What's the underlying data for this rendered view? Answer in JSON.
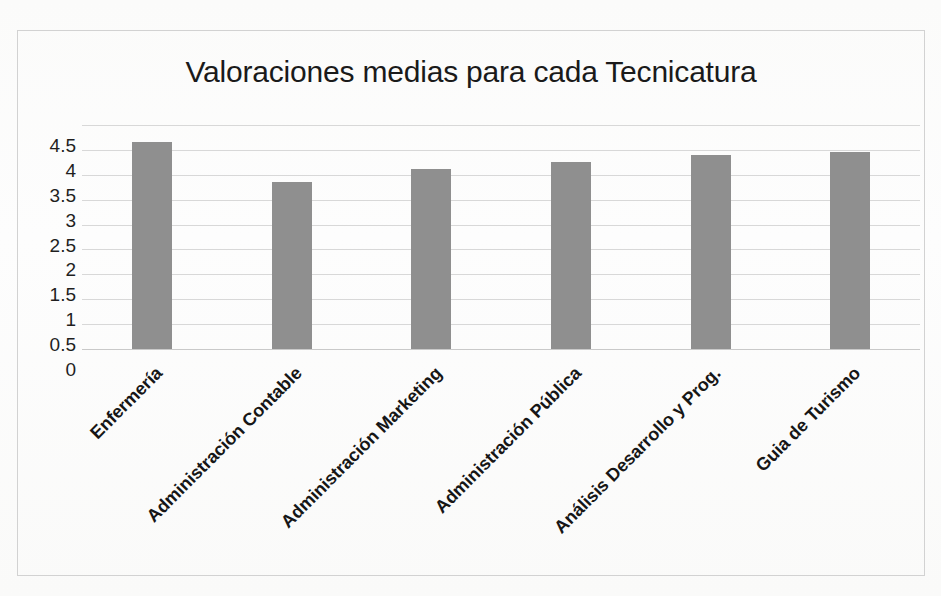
{
  "chart_data": {
    "type": "bar",
    "title": "Valoraciones medias para cada Tecnicatura",
    "xlabel": "",
    "ylabel": "",
    "ylim": [
      0,
      4.5
    ],
    "ytick_step": 0.5,
    "yticks": [
      "4.5",
      "4",
      "3.5",
      "3",
      "2.5",
      "2",
      "1.5",
      "1",
      "0.5",
      "0"
    ],
    "grid": true,
    "legend": "none",
    "bar_color": "#8f8f8f",
    "categories": [
      "Enfermería",
      "Administración Contable",
      "Administración Marketing",
      "Administración Pública",
      "Análisis Desarrollo y Prog.",
      "Guia de Turismo"
    ],
    "values": [
      4.15,
      3.36,
      3.62,
      3.76,
      3.9,
      3.95
    ]
  },
  "frame": {
    "border_color": "#d2d2d2"
  }
}
